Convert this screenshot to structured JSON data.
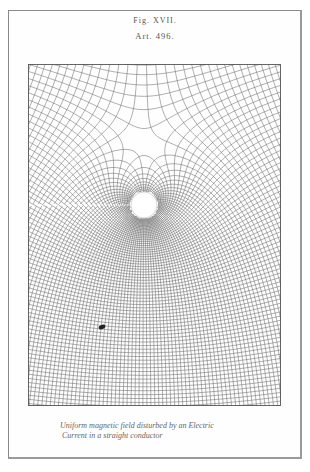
{
  "figure": {
    "number": "Fig. XVII.",
    "article": "Art. 496.",
    "caption_line1": "Uniform magnetic field disturbed by an Electric",
    "caption_line2": "Current in a straight conductor"
  },
  "diagram": {
    "type": "field-lines",
    "frame": {
      "x": 28,
      "y": 64,
      "width": 253,
      "height": 342
    },
    "conductor": {
      "cx": 116,
      "cy": 141,
      "radius": 13
    },
    "uniform_field_strength": 1.0,
    "current_strength": 62,
    "potential_step": 5.2,
    "stream_step": 5.2,
    "line_color": "#6e6e6e",
    "frame_color": "#555555",
    "blot": {
      "cx": 74,
      "cy": 263
    }
  }
}
